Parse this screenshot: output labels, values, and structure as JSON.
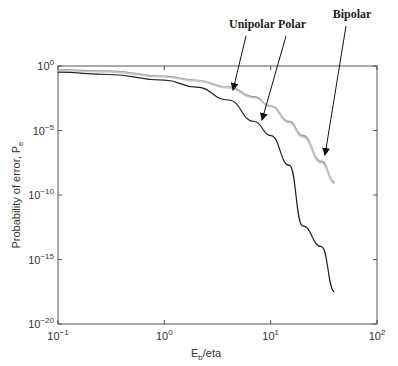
{
  "chart_data": {
    "type": "line",
    "title": "",
    "xlabel": "E_b/eta",
    "ylabel": "Probability of error, P_e",
    "xscale": "log",
    "yscale": "log",
    "xlim": [
      0.1,
      100
    ],
    "ylim": [
      1e-20,
      1
    ],
    "x_ticks": [
      "10^-1",
      "10^0",
      "10^1",
      "10^2"
    ],
    "y_ticks": [
      "10^0",
      "10^-5",
      "10^-10",
      "10^-15",
      "10^-20"
    ],
    "grid": false,
    "legend": "annotations with arrows",
    "series": [
      {
        "name": "Unipolar",
        "color": "#9a9a9a",
        "x": [
          0.1,
          0.3,
          1,
          2,
          4,
          7,
          10,
          15,
          20,
          30,
          40
        ],
        "y": [
          0.5,
          0.4,
          0.16,
          0.08,
          0.023,
          0.004,
          0.0008,
          5e-05,
          4e-06,
          4e-08,
          1e-09
        ]
      },
      {
        "name": "Bipolar",
        "color": "#c8c8c8",
        "x": [
          0.1,
          0.3,
          1,
          2,
          4,
          7,
          10,
          15,
          20,
          30,
          40
        ],
        "y": [
          0.45,
          0.35,
          0.14,
          0.07,
          0.02,
          0.0035,
          0.0007,
          4e-05,
          3e-06,
          3e-08,
          8e-10
        ]
      },
      {
        "name": "Polar",
        "color": "#222222",
        "x": [
          0.1,
          0.3,
          1,
          2,
          4,
          7,
          10,
          15,
          20,
          30,
          40
        ],
        "y": [
          0.33,
          0.22,
          0.08,
          0.023,
          0.0023,
          5e-05,
          4e-06,
          2e-08,
          4e-13,
          1e-14,
          3e-18
        ]
      }
    ],
    "annotations": [
      {
        "text": "Unipolar",
        "label_pos": [
          252,
          28
        ],
        "arrow_to": [
          233,
          90
        ]
      },
      {
        "text": "Polar",
        "label_pos": [
          292,
          28
        ],
        "arrow_to": [
          262,
          120
        ]
      },
      {
        "text": "Bipolar",
        "label_pos": [
          352,
          18
        ],
        "arrow_to": [
          325,
          155
        ]
      }
    ]
  },
  "axes": {
    "xlabel_main": "E",
    "xlabel_sub": "b",
    "xlabel_rest": "/eta",
    "ylabel_main": "Probability of error, P",
    "ylabel_sub": "e"
  }
}
